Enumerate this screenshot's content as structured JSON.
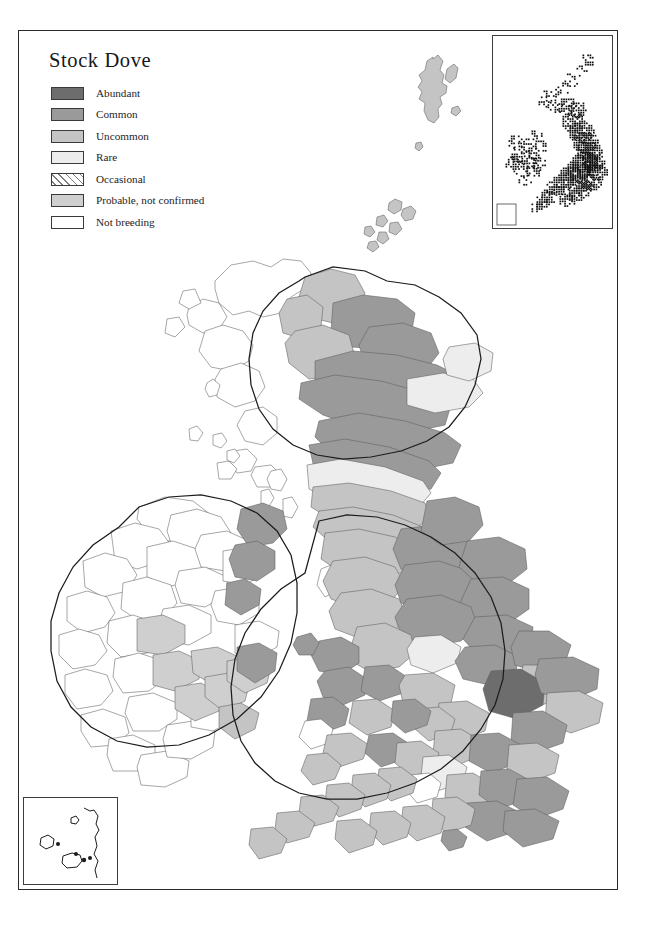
{
  "map_title": "Stock Dove",
  "legend": {
    "name": "distribution-abundance-legend",
    "items": [
      {
        "label": "Abundant",
        "key": "abundant",
        "color": "#6d6d6d",
        "pattern": "solid"
      },
      {
        "label": "Common",
        "key": "common",
        "color": "#9a9a9a",
        "pattern": "solid"
      },
      {
        "label": "Uncommon",
        "key": "uncommon",
        "color": "#c4c4c4",
        "pattern": "solid"
      },
      {
        "label": "Rare",
        "key": "rare",
        "color": "#ededed",
        "pattern": "solid"
      },
      {
        "label": "Occasional",
        "key": "occasional",
        "color": "#ffffff",
        "pattern": "diagonal-hatch"
      },
      {
        "label": "Probable, not confirmed",
        "key": "probable",
        "color": "#cfcfcf",
        "pattern": "solid"
      },
      {
        "label": "Not breeding",
        "key": "not_breeding",
        "color": "#ffffff",
        "pattern": "solid"
      }
    ]
  },
  "insets": {
    "dot_map": {
      "name": "breeding-distribution-dot-map",
      "description": "Dot distribution inset of Britain and Ireland"
    },
    "channel_islands": {
      "name": "channel-islands-inset",
      "description": "Channel Islands inset, no breeding shading"
    }
  },
  "chart_data": {
    "type": "map",
    "title": "Stock Dove",
    "map_kind": "choropleth-distribution-atlas",
    "region": "Britain and Ireland",
    "legend_position": "top-left",
    "categories": [
      "Abundant",
      "Common",
      "Uncommon",
      "Rare",
      "Occasional",
      "Probable, not confirmed",
      "Not breeding"
    ],
    "category_colors": [
      "#6d6d6d",
      "#9a9a9a",
      "#c4c4c4",
      "#ededed",
      "#ffffff",
      "#cfcfcf",
      "#ffffff"
    ],
    "insets": [
      "dot distribution map (top right)",
      "Channel Islands (bottom left)"
    ]
  }
}
